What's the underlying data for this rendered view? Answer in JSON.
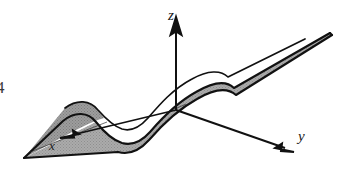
{
  "figure": {
    "caption_fragment": "4",
    "background_color": "#ffffff",
    "stroke_color": "#111111",
    "surface_fill_color": "#a8a8a8",
    "surface_fill_dark_color": "#9a9a9a"
  },
  "axes": {
    "z": {
      "label": "z",
      "icon": "arrow-up-icon",
      "direction": "up",
      "origin": [
        176,
        108
      ],
      "tip": [
        176,
        18
      ]
    },
    "y": {
      "label": "y",
      "icon": "arrow-down-right-icon",
      "direction": "down-right",
      "origin": [
        176,
        108
      ],
      "tip": [
        292,
        152
      ]
    },
    "x": {
      "label": "x",
      "icon": "arrow-down-left-icon",
      "direction": "down-left",
      "origin": [
        176,
        108
      ],
      "tip": [
        62,
        140
      ]
    }
  }
}
